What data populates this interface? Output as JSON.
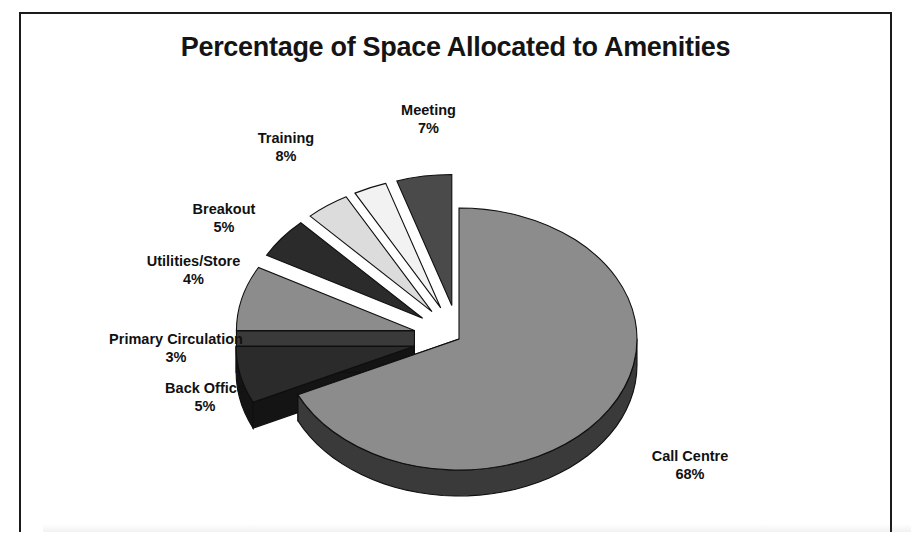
{
  "chart_data": {
    "type": "pie",
    "title": "Percentage of Space Allocated to Amenities",
    "subtitle": "",
    "xlabel": "",
    "ylabel": "",
    "style": "exploded-3d-pie",
    "legend": "none",
    "grid": false,
    "value_unit": "%",
    "categories": [
      "Call Centre",
      "Meeting",
      "Training",
      "Breakout",
      "Utilities/Store",
      "Primary Circulation",
      "Back Office"
    ],
    "values": [
      68,
      7,
      8,
      5,
      4,
      3,
      5
    ],
    "labels": [
      "Call Centre\n68%",
      "Meeting\n7%",
      "Training\n8%",
      "Breakout\n5%",
      "Utilities/Store\n4%",
      "Primary Circulation\n3%",
      "Back Office\n5%"
    ],
    "slices": [
      {
        "name": "Call Centre",
        "value": 68,
        "value_text": "68%",
        "color": "#8c8c8c",
        "side_color": "#3a3a3a",
        "exploded": false
      },
      {
        "name": "Meeting",
        "value": 7,
        "value_text": "7%",
        "color": "#2b2b2b",
        "side_color": "#141414",
        "exploded": true
      },
      {
        "name": "Training",
        "value": 8,
        "value_text": "8%",
        "color": "#8c8c8c",
        "side_color": "#3a3a3a",
        "exploded": true
      },
      {
        "name": "Breakout",
        "value": 5,
        "value_text": "5%",
        "color": "#2b2b2b",
        "side_color": "#141414",
        "exploded": true
      },
      {
        "name": "Utilities/Store",
        "value": 4,
        "value_text": "4%",
        "color": "#dcdcdc",
        "side_color": "#6e6e6e",
        "exploded": true
      },
      {
        "name": "Primary Circulation",
        "value": 3,
        "value_text": "3%",
        "color": "#f2f2f2",
        "side_color": "#6e6e6e",
        "exploded": true
      },
      {
        "name": "Back Office",
        "value": 5,
        "value_text": "5%",
        "color": "#4a4a4a",
        "side_color": "#1e1e1e",
        "exploded": true
      }
    ]
  },
  "chart": {
    "title": "Percentage of Space Allocated to Amenities",
    "frame_color": "#1a1a1a",
    "background": "#ffffff"
  },
  "labels": {
    "meeting": {
      "name": "Meeting",
      "pct": "7%"
    },
    "training": {
      "name": "Training",
      "pct": "8%"
    },
    "breakout": {
      "name": "Breakout",
      "pct": "5%"
    },
    "utilities": {
      "name": "Utilities/Store",
      "pct": "4%"
    },
    "primary": {
      "name": "Primary Circulation",
      "pct": "3%"
    },
    "backoffice": {
      "name": "Back Office",
      "pct": "5%"
    },
    "callcentre": {
      "name": "Call Centre",
      "pct": "68%"
    }
  }
}
